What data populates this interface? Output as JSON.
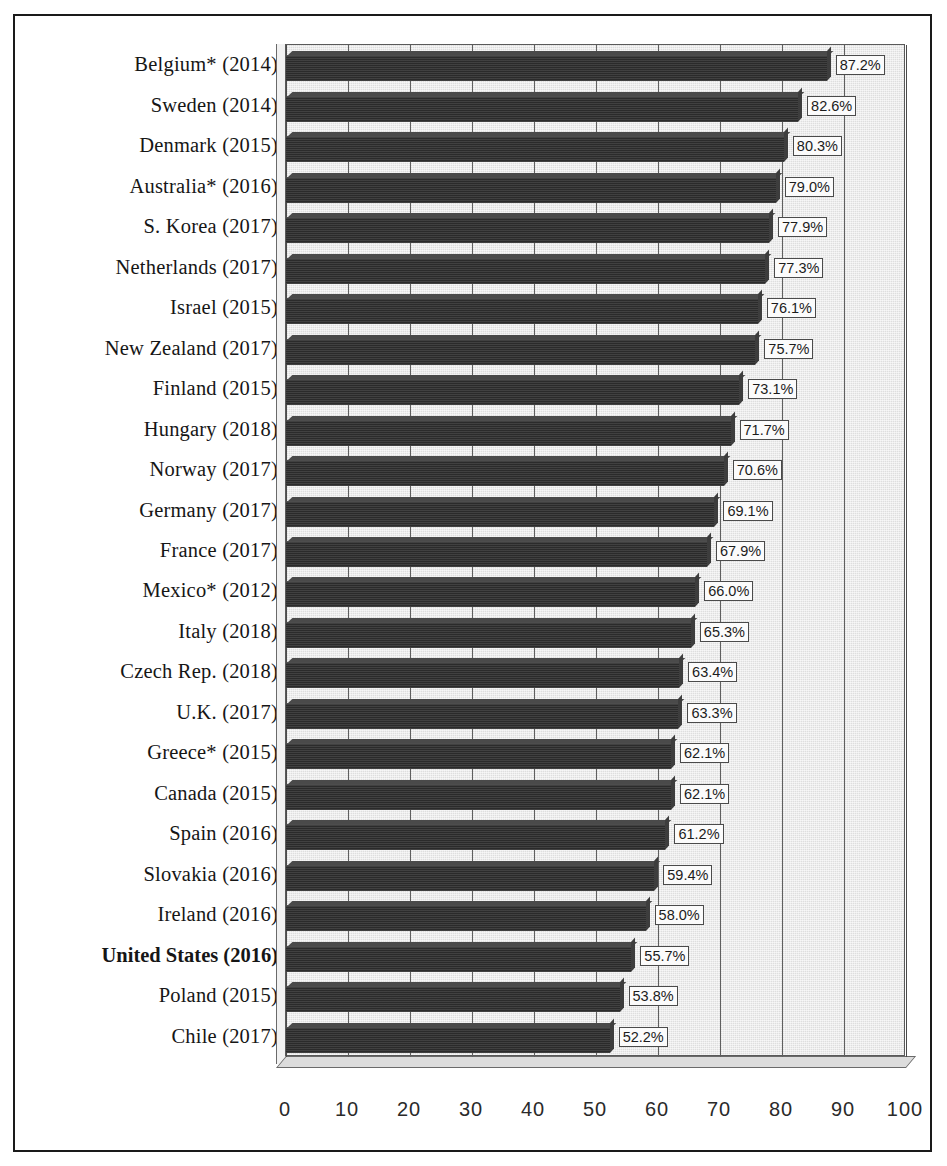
{
  "chart_data": {
    "type": "bar",
    "orientation": "horizontal",
    "title": "",
    "subtitle": "",
    "xlabel": "",
    "ylabel": "",
    "xlim": [
      0,
      100
    ],
    "xticks": [
      0,
      10,
      20,
      30,
      40,
      50,
      60,
      70,
      80,
      90,
      100
    ],
    "xtick_labels": [
      "0",
      "10",
      "20",
      "30",
      "40",
      "50",
      "60",
      "70",
      "80",
      "90",
      "100"
    ],
    "grid": "vertical",
    "legend": "none",
    "value_suffix": "%",
    "highlight_category": "United States (2016)",
    "categories": [
      "Belgium* (2014)",
      "Sweden (2014)",
      "Denmark (2015)",
      "Australia* (2016)",
      "S. Korea (2017)",
      "Netherlands (2017)",
      "Israel (2015)",
      "New Zealand (2017)",
      "Finland (2015)",
      "Hungary (2018)",
      "Norway (2017)",
      "Germany (2017)",
      "France (2017)",
      "Mexico* (2012)",
      "Italy (2018)",
      "Czech Rep. (2018)",
      "U.K. (2017)",
      "Greece* (2015)",
      "Canada (2015)",
      "Spain (2016)",
      "Slovakia (2016)",
      "Ireland (2016)",
      "United States (2016)",
      "Poland (2015)",
      "Chile (2017)"
    ],
    "values": [
      87.2,
      82.6,
      80.3,
      79.0,
      77.9,
      77.3,
      76.1,
      75.7,
      73.1,
      71.7,
      70.6,
      69.1,
      67.9,
      66.0,
      65.3,
      63.4,
      63.3,
      62.1,
      62.1,
      61.2,
      59.4,
      58.0,
      55.7,
      53.8,
      52.2
    ],
    "value_labels": [
      "87.2%",
      "82.6%",
      "80.3%",
      "79.0%",
      "77.9%",
      "77.3%",
      "76.1%",
      "75.7%",
      "73.1%",
      "71.7%",
      "70.6%",
      "69.1%",
      "67.9%",
      "66.0%",
      "65.3%",
      "63.4%",
      "63.3%",
      "62.1%",
      "62.1%",
      "61.2%",
      "59.4%",
      "58.0%",
      "55.7%",
      "53.8%",
      "52.2%"
    ]
  },
  "colors": {
    "bar_fill": "#2b2b2b",
    "bar_top": "#4a4a4a",
    "bar_cap": "#3d3d3d",
    "plot_background": "#dedede",
    "gridline": "#5f5f5f",
    "frame": "#1a1a1a",
    "label_text": "#161616",
    "value_label_background": "#fbfbfb"
  }
}
